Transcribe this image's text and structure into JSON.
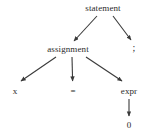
{
  "diagram": {
    "type": "parse-tree",
    "title": "",
    "background_color": "#ffffff",
    "line_color": "#3a3a3a",
    "text_color": "#2b2b2b",
    "nodes": [
      {
        "id": "statement",
        "label": "statement",
        "x": 103,
        "y": 8,
        "level": 0
      },
      {
        "id": "assignment",
        "label": "assignment",
        "x": 68,
        "y": 49,
        "level": 1
      },
      {
        "id": "semicolon",
        "label": ";",
        "x": 134,
        "y": 49,
        "level": 1
      },
      {
        "id": "x",
        "label": "x",
        "x": 15,
        "y": 91,
        "level": 2
      },
      {
        "id": "equals",
        "label": "=",
        "x": 73,
        "y": 91,
        "level": 2
      },
      {
        "id": "expr",
        "label": "expr",
        "x": 129,
        "y": 91,
        "level": 2
      },
      {
        "id": "zero",
        "label": "0",
        "x": 129,
        "y": 125,
        "level": 3
      }
    ],
    "edges": [
      {
        "from": "statement",
        "to": "assignment",
        "arrow": true
      },
      {
        "from": "statement",
        "to": "semicolon",
        "arrow": true
      },
      {
        "from": "assignment",
        "to": "x",
        "arrow": true
      },
      {
        "from": "assignment",
        "to": "equals",
        "arrow": true
      },
      {
        "from": "assignment",
        "to": "expr",
        "arrow": true
      },
      {
        "from": "expr",
        "to": "zero",
        "arrow": true
      }
    ]
  }
}
